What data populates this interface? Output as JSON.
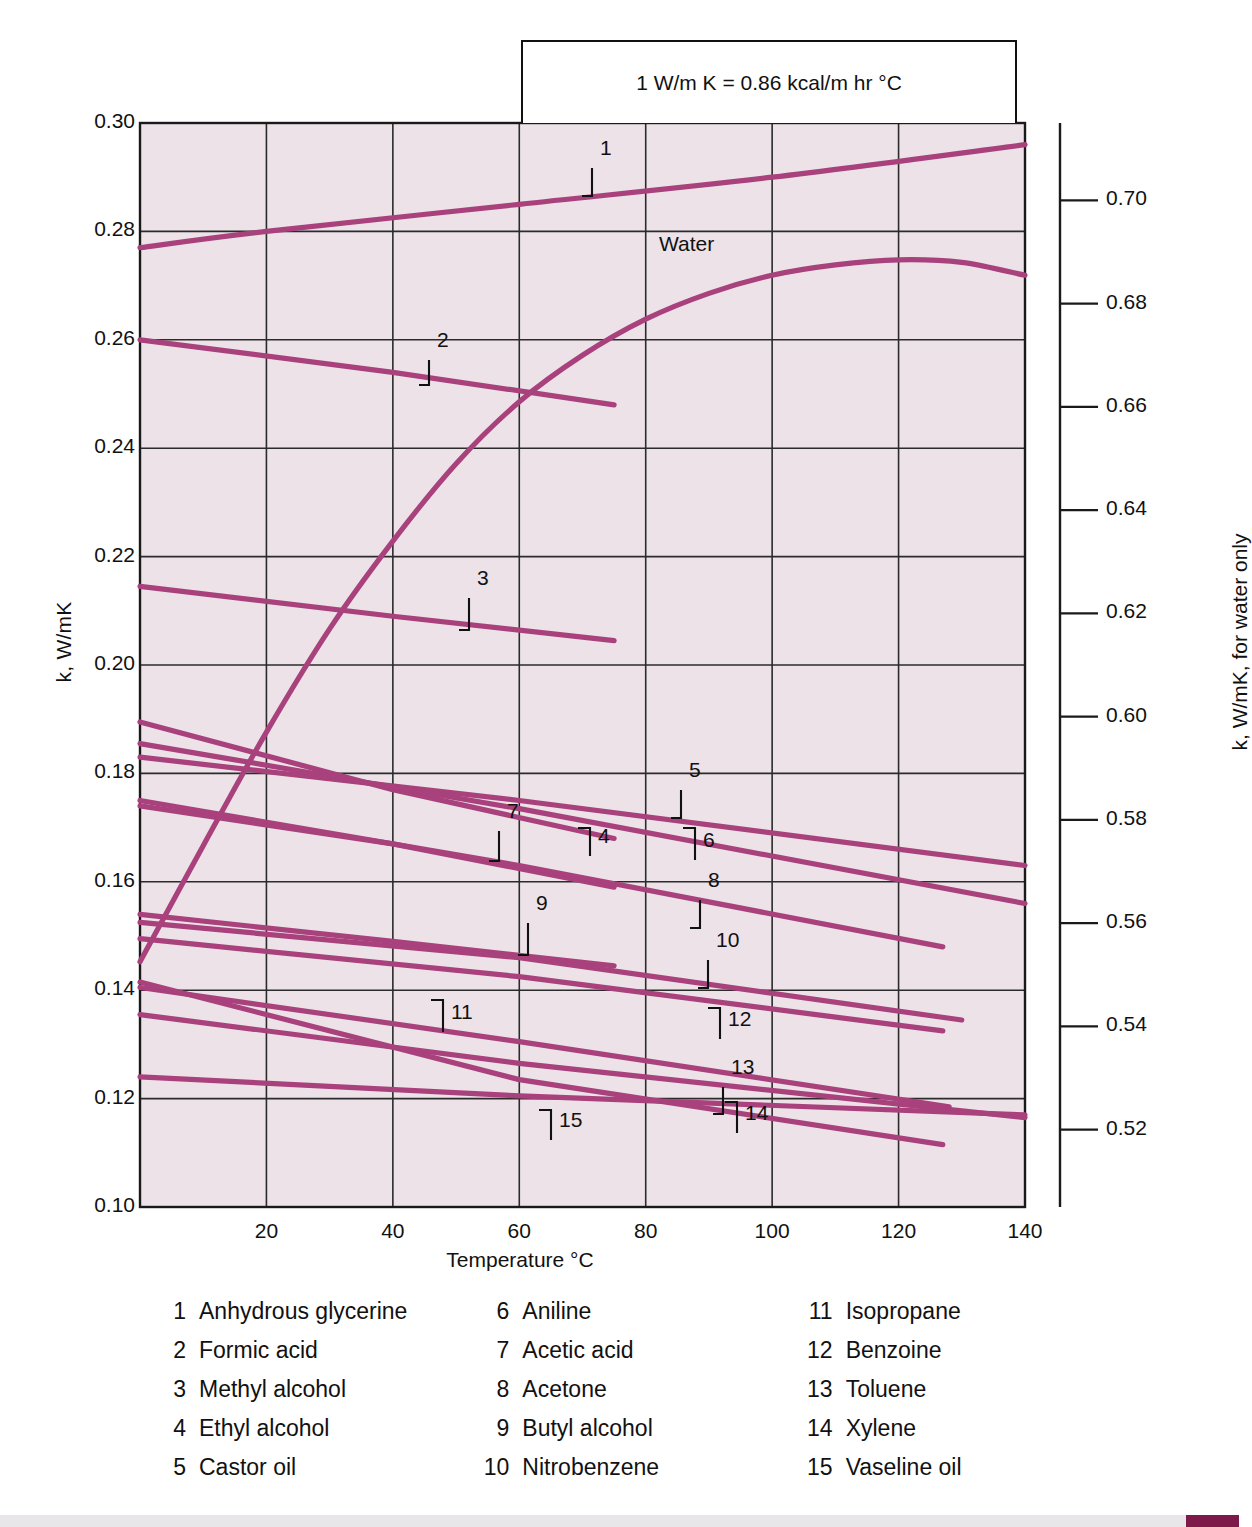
{
  "note": {
    "text": "1 W/m K = 0.86 kcal/m hr °C"
  },
  "axes": {
    "left_title": "k, W/mK",
    "right_title": "k, W/mK, for water only",
    "bottom_title": "Temperature °C",
    "water_label": "Water"
  },
  "chart_data": {
    "type": "line",
    "xlabel": "Temperature °C",
    "ylabel": "k, W/mK",
    "ylabel_right": "k, W/mK, for water only",
    "annotation": "1 W/m K = 0.86 kcal/m hr °C",
    "grid": true,
    "legend_position": "below",
    "xlim": [
      0,
      140
    ],
    "ylim": [
      0.1,
      0.3
    ],
    "ylim_right": [
      0.505,
      0.715
    ],
    "xticks": [
      20,
      40,
      60,
      80,
      100,
      120,
      140
    ],
    "xtick_labels": [
      "20",
      "40",
      "60",
      "80",
      "100",
      "120",
      "140"
    ],
    "yticks": [
      0.1,
      0.12,
      0.14,
      0.16,
      0.18,
      0.2,
      0.22,
      0.24,
      0.26,
      0.28,
      0.3
    ],
    "ytick_labels": [
      "0.10",
      "0.12",
      "0.14",
      "0.16",
      "0.18",
      "0.20",
      "0.22",
      "0.24",
      "0.26",
      "0.28",
      "0.30"
    ],
    "yticks_right": [
      0.52,
      0.54,
      0.56,
      0.58,
      0.6,
      0.62,
      0.64,
      0.66,
      0.68,
      0.7
    ],
    "ytick_labels_right": [
      "0.52",
      "0.54",
      "0.56",
      "0.58",
      "0.60",
      "0.62",
      "0.64",
      "0.66",
      "0.68",
      "0.70"
    ],
    "line_color": "#a8417c",
    "plot_background": "#ece2e8",
    "series": [
      {
        "name": "Anhydrous glycerine",
        "number": "1",
        "axis": "left",
        "x": [
          0,
          20,
          60,
          100,
          140
        ],
        "values": [
          0.277,
          0.28,
          0.285,
          0.29,
          0.296
        ]
      },
      {
        "name": "Formic acid",
        "number": "2",
        "axis": "left",
        "x": [
          0,
          40,
          75
        ],
        "values": [
          0.26,
          0.254,
          0.248
        ]
      },
      {
        "name": "Methyl alcohol",
        "number": "3",
        "axis": "left",
        "x": [
          0,
          40,
          75
        ],
        "values": [
          0.2145,
          0.209,
          0.2045
        ]
      },
      {
        "name": "Ethyl alcohol",
        "number": "4",
        "axis": "left",
        "x": [
          0,
          40,
          75
        ],
        "values": [
          0.1895,
          0.177,
          0.168
        ]
      },
      {
        "name": "Castor oil",
        "number": "5",
        "axis": "left",
        "x": [
          0,
          60,
          140
        ],
        "values": [
          0.183,
          0.175,
          0.163
        ]
      },
      {
        "name": "Aniline",
        "number": "6",
        "axis": "left",
        "x": [
          0,
          60,
          140
        ],
        "values": [
          0.1855,
          0.1735,
          0.156
        ]
      },
      {
        "name": "Acetic acid",
        "number": "7",
        "axis": "left",
        "x": [
          0,
          40,
          75
        ],
        "values": [
          0.174,
          0.167,
          0.159
        ]
      },
      {
        "name": "Acetone",
        "number": "8",
        "axis": "left",
        "x": [
          0,
          60,
          127
        ],
        "values": [
          0.175,
          0.163,
          0.148
        ]
      },
      {
        "name": "Butyl alcohol",
        "number": "9",
        "axis": "left",
        "x": [
          0,
          40,
          75
        ],
        "values": [
          0.154,
          0.149,
          0.1445
        ]
      },
      {
        "name": "Nitrobenzene",
        "number": "10",
        "axis": "left",
        "x": [
          0,
          60,
          130
        ],
        "values": [
          0.1525,
          0.146,
          0.1345
        ]
      },
      {
        "name": "Isopropane",
        "number": "11",
        "axis": "left",
        "x": [
          0,
          60,
          127
        ],
        "values": [
          0.1495,
          0.1425,
          0.1325
        ]
      },
      {
        "name": "Benzoine",
        "number": "12",
        "axis": "left",
        "x": [
          0,
          60,
          128
        ],
        "values": [
          0.1405,
          0.1305,
          0.1185
        ]
      },
      {
        "name": "Toluene",
        "number": "13",
        "axis": "left",
        "x": [
          0,
          60,
          140
        ],
        "values": [
          0.1355,
          0.1265,
          0.1165
        ]
      },
      {
        "name": "Xylene",
        "number": "14",
        "axis": "left",
        "x": [
          0,
          60,
          127
        ],
        "values": [
          0.1415,
          0.1235,
          0.1115
        ]
      },
      {
        "name": "Vaseline oil",
        "number": "15",
        "axis": "left",
        "x": [
          0,
          60,
          140
        ],
        "values": [
          0.124,
          0.1205,
          0.117
        ]
      },
      {
        "name": "Water",
        "number": "W",
        "axis": "right",
        "x": [
          0,
          10,
          20,
          30,
          40,
          50,
          60,
          70,
          80,
          90,
          100,
          110,
          120,
          130,
          140
        ],
        "values": [
          0.5525,
          0.575,
          0.597,
          0.617,
          0.634,
          0.649,
          0.661,
          0.67,
          0.677,
          0.682,
          0.6855,
          0.6875,
          0.6885,
          0.688,
          0.6855
        ]
      }
    ],
    "curve_tags": [
      {
        "label": "1",
        "x": 600,
        "y": 150
      },
      {
        "label": "2",
        "x": 437,
        "y": 342
      },
      {
        "label": "3",
        "x": 477,
        "y": 580
      },
      {
        "label": "4",
        "x": 598,
        "y": 838
      },
      {
        "label": "5",
        "x": 689,
        "y": 772
      },
      {
        "label": "6",
        "x": 703,
        "y": 842
      },
      {
        "label": "7",
        "x": 507,
        "y": 813
      },
      {
        "label": "8",
        "x": 708,
        "y": 882
      },
      {
        "label": "9",
        "x": 536,
        "y": 905
      },
      {
        "label": "10",
        "x": 716,
        "y": 942
      },
      {
        "label": "11",
        "x": 451,
        "y": 1014
      },
      {
        "label": "12",
        "x": 728,
        "y": 1021
      },
      {
        "label": "13",
        "x": 731,
        "y": 1069
      },
      {
        "label": "14",
        "x": 745,
        "y": 1115
      },
      {
        "label": "15",
        "x": 559,
        "y": 1122
      }
    ]
  },
  "legend": {
    "columns": [
      [
        {
          "num": "1",
          "name": "Anhydrous glycerine"
        },
        {
          "num": "2",
          "name": "Formic acid"
        },
        {
          "num": "3",
          "name": "Methyl alcohol"
        },
        {
          "num": "4",
          "name": "Ethyl alcohol"
        },
        {
          "num": "5",
          "name": "Castor oil"
        }
      ],
      [
        {
          "num": "6",
          "name": "Aniline"
        },
        {
          "num": "7",
          "name": "Acetic acid"
        },
        {
          "num": "8",
          "name": "Acetone"
        },
        {
          "num": "9",
          "name": "Butyl alcohol"
        },
        {
          "num": "10",
          "name": "Nitrobenzene"
        }
      ],
      [
        {
          "num": "11",
          "name": "Isopropane"
        },
        {
          "num": "12",
          "name": "Benzoine"
        },
        {
          "num": "13",
          "name": "Toluene"
        },
        {
          "num": "14",
          "name": "Xylene"
        },
        {
          "num": "15",
          "name": "Vaseline oil"
        }
      ]
    ]
  }
}
